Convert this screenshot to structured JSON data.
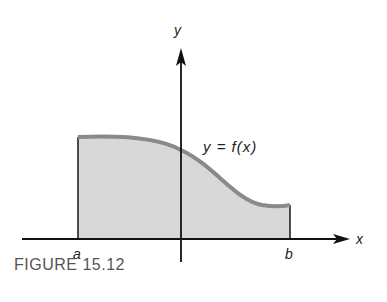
{
  "figure": {
    "caption": "FIGURE 15.12",
    "curve_label": "y = f(x)",
    "x_axis_label": "x",
    "y_axis_label": "y",
    "lower_bound_label": "a",
    "upper_bound_label": "b"
  },
  "colors": {
    "fill": "#d8d8d8",
    "curve": "#8a8a8a",
    "axis": "#111111"
  }
}
